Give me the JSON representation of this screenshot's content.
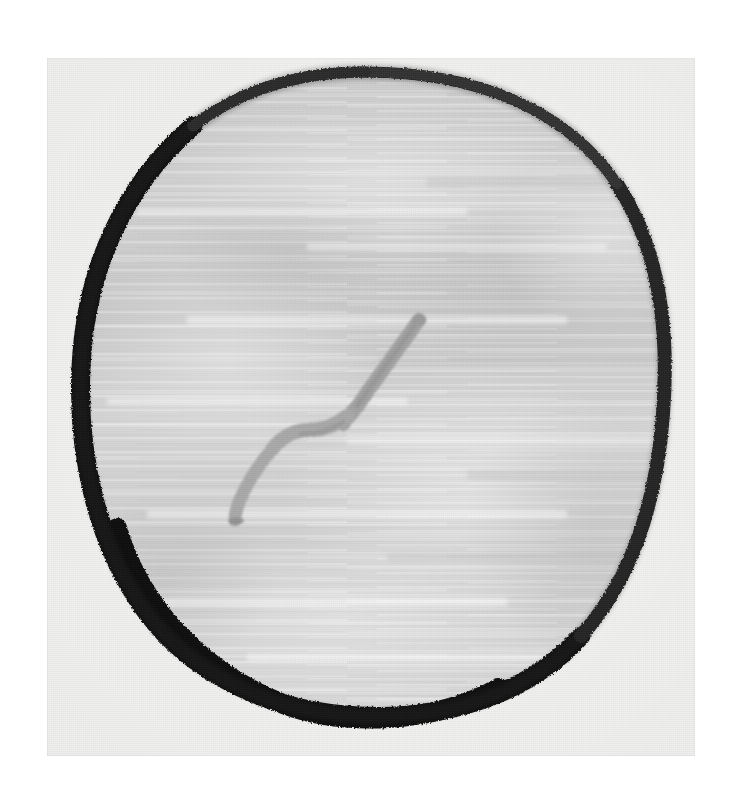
{
  "canvas": {
    "width": 742,
    "height": 792,
    "background_color": "#ffffff",
    "alt_text": "Photograph of a hand-drawn marker sketch: a thick black irregular circle outline filled with light grey marker shading, containing a grey bent stem-like squiggle near the centre."
  },
  "photo": {
    "name": "scanned-drawing-photo",
    "left": 47,
    "top": 58,
    "width": 648,
    "height": 698,
    "paper_color": "#f1f1f0",
    "caption": ""
  },
  "artwork": {
    "title": "",
    "medium": "marker on paper",
    "subject": "circle with bent stem",
    "shapes": [
      {
        "id": "outline-circle",
        "name": "hand-drawn black circle outline",
        "role": "outline",
        "stroke_color": "#171717",
        "stroke_color_light": "#3b3b3b",
        "fill": "none",
        "stroke_width_min": 9,
        "stroke_width_max": 22,
        "bounds": {
          "x": 25,
          "y": 10,
          "width": 593,
          "height": 644
        }
      },
      {
        "id": "interior-fill",
        "name": "grey marker interior shading",
        "role": "fill",
        "fill_color": "#cfcfcf",
        "fill_color_light": "#dedede",
        "fill_color_dark": "#c2c2c2",
        "texture": "horizontal brush streaks"
      },
      {
        "id": "stem-squiggle",
        "name": "grey bent stem squiggle",
        "role": "detail",
        "stroke_color": "#a6a6a6",
        "stroke_color_dark": "#949494",
        "stroke_width": 13,
        "top_tip": {
          "x": 372,
          "y": 260
        },
        "bend": {
          "x": 300,
          "y": 362
        },
        "bottom_tip": {
          "x": 190,
          "y": 460
        }
      }
    ],
    "palette": {
      "background": "#ffffff",
      "paper": "#f1f1f0",
      "ink_black": "#171717",
      "marker_grey": "#cfcfcf",
      "stem_grey": "#a6a6a6"
    }
  }
}
